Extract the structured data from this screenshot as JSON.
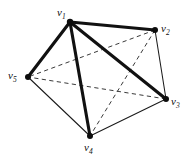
{
  "figure": {
    "background_color": "#ffffff",
    "width": 188,
    "height": 159,
    "label_v1": "v",
    "label_v2": "v",
    "label_v3": "v",
    "label_v4": "v",
    "label_v5": "v",
    "sub_v1": "1",
    "sub_v2": "2",
    "sub_v3": "3",
    "sub_v4": "4",
    "sub_v5": "5"
  },
  "chart_data": {
    "type": "diagram",
    "diagram_kind": "undirected-graph",
    "title": "",
    "graph_name": "K5",
    "vertex_count": 5,
    "edge_count": 10,
    "colors": {
      "bold_edge": "#111111",
      "thin_edge": "#1a1a1a",
      "dashed_edge": "#3a3a3a",
      "vertex": "#0d0d0d",
      "background": "#ffffff"
    },
    "nodes": [
      {
        "id": "v1",
        "label": "v1",
        "x": 70,
        "y": 22,
        "label_x": 57,
        "label_y": 7,
        "radius": 3.2
      },
      {
        "id": "v2",
        "label": "v2",
        "x": 155,
        "y": 30,
        "label_x": 161,
        "label_y": 23,
        "radius": 3.0
      },
      {
        "id": "v3",
        "label": "v3",
        "x": 166,
        "y": 99,
        "label_x": 171,
        "label_y": 96,
        "radius": 3.0
      },
      {
        "id": "v4",
        "label": "v4",
        "x": 90,
        "y": 136,
        "label_x": 84,
        "label_y": 142,
        "radius": 3.0
      },
      {
        "id": "v5",
        "label": "v5",
        "x": 28,
        "y": 77,
        "label_x": 8,
        "label_y": 70,
        "radius": 3.0
      }
    ],
    "edges": [
      {
        "source": "v1",
        "target": "v2",
        "style": "bold",
        "x1": 70,
        "y1": 22,
        "x2": 155,
        "y2": 30
      },
      {
        "source": "v1",
        "target": "v3",
        "style": "bold",
        "x1": 70,
        "y1": 22,
        "x2": 166,
        "y2": 99
      },
      {
        "source": "v1",
        "target": "v4",
        "style": "bold",
        "x1": 70,
        "y1": 22,
        "x2": 90,
        "y2": 136
      },
      {
        "source": "v1",
        "target": "v5",
        "style": "bold",
        "x1": 70,
        "y1": 22,
        "x2": 28,
        "y2": 77
      },
      {
        "source": "v2",
        "target": "v3",
        "style": "thin",
        "x1": 155,
        "y1": 30,
        "x2": 166,
        "y2": 99
      },
      {
        "source": "v3",
        "target": "v4",
        "style": "thin",
        "x1": 166,
        "y1": 99,
        "x2": 90,
        "y2": 136
      },
      {
        "source": "v4",
        "target": "v5",
        "style": "thin",
        "x1": 90,
        "y1": 136,
        "x2": 28,
        "y2": 77
      },
      {
        "source": "v2",
        "target": "v4",
        "style": "dashed",
        "x1": 155,
        "y1": 30,
        "x2": 90,
        "y2": 136
      },
      {
        "source": "v2",
        "target": "v5",
        "style": "dashed",
        "x1": 155,
        "y1": 30,
        "x2": 28,
        "y2": 77
      },
      {
        "source": "v3",
        "target": "v5",
        "style": "dashed",
        "x1": 166,
        "y1": 99,
        "x2": 28,
        "y2": 77
      }
    ],
    "legend": [],
    "annotations": []
  }
}
